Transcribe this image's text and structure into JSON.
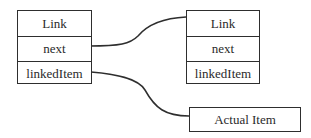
{
  "diagram": {
    "type": "linked-list-structure",
    "nodes": [
      {
        "id": "link1",
        "fields": [
          "Link",
          "next",
          "linkedItem"
        ]
      },
      {
        "id": "link2",
        "fields": [
          "Link",
          "next",
          "linkedItem"
        ]
      },
      {
        "id": "actual",
        "label": "Actual Item"
      }
    ],
    "edges": [
      {
        "from": "link1.next",
        "to": "link2"
      },
      {
        "from": "link1.linkedItem",
        "to": "actual"
      }
    ],
    "line_color": "#2e2e2e"
  }
}
